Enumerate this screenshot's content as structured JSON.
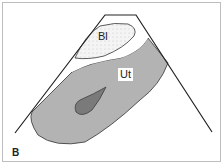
{
  "diagram": {
    "panel_label": "B",
    "labels": {
      "bladder": "Bl",
      "uterus": "Ut"
    },
    "colors": {
      "uterus_fill": "#b3b3b3",
      "lesion_fill": "#7a7a7a",
      "bladder_fill": "#f2f2f2",
      "outline": "#222222"
    }
  }
}
